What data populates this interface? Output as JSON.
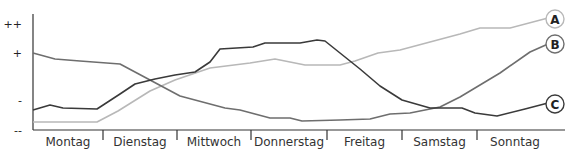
{
  "chart_data": {
    "type": "line",
    "title": "",
    "xlabel": "",
    "ylabel": "",
    "categories": [
      "Montag",
      "Dienstag",
      "Mittwoch",
      "Donnerstag",
      "Freitag",
      "Samstag",
      "Sonntag"
    ],
    "y_ticks": [
      "++",
      "+",
      "-",
      "--"
    ],
    "grid": false,
    "legend_position": "inline-right",
    "series": [
      {
        "name": "A",
        "color": "#b8b8b8",
        "points": [
          [
            33,
            122
          ],
          [
            97,
            122
          ],
          [
            118,
            111
          ],
          [
            150,
            91
          ],
          [
            175,
            80
          ],
          [
            210,
            68
          ],
          [
            250,
            63
          ],
          [
            275,
            59
          ],
          [
            305,
            65
          ],
          [
            340,
            65
          ],
          [
            355,
            61
          ],
          [
            378,
            53
          ],
          [
            400,
            50
          ],
          [
            430,
            42
          ],
          [
            460,
            34
          ],
          [
            480,
            28
          ],
          [
            510,
            28
          ],
          [
            548,
            18
          ]
        ]
      },
      {
        "name": "B",
        "color": "#6e6e6e",
        "points": [
          [
            33,
            53
          ],
          [
            55,
            59
          ],
          [
            80,
            61
          ],
          [
            120,
            64
          ],
          [
            150,
            80
          ],
          [
            180,
            96
          ],
          [
            225,
            108
          ],
          [
            240,
            110
          ],
          [
            270,
            118
          ],
          [
            290,
            118
          ],
          [
            302,
            121
          ],
          [
            340,
            120
          ],
          [
            370,
            119
          ],
          [
            390,
            114
          ],
          [
            410,
            113
          ],
          [
            440,
            107
          ],
          [
            460,
            97
          ],
          [
            500,
            73
          ],
          [
            530,
            52
          ],
          [
            548,
            44
          ]
        ]
      },
      {
        "name": "C",
        "color": "#3a3a3a",
        "points": [
          [
            33,
            110
          ],
          [
            50,
            105
          ],
          [
            63,
            108
          ],
          [
            97,
            109
          ],
          [
            120,
            94
          ],
          [
            135,
            84
          ],
          [
            155,
            79
          ],
          [
            175,
            75
          ],
          [
            195,
            72
          ],
          [
            210,
            62
          ],
          [
            220,
            49
          ],
          [
            253,
            47
          ],
          [
            265,
            43
          ],
          [
            300,
            43
          ],
          [
            317,
            40
          ],
          [
            325,
            41
          ],
          [
            360,
            69
          ],
          [
            380,
            86
          ],
          [
            402,
            100
          ],
          [
            430,
            108
          ],
          [
            462,
            108
          ],
          [
            475,
            113
          ],
          [
            497,
            116
          ],
          [
            525,
            109
          ],
          [
            548,
            103
          ]
        ]
      }
    ],
    "labels": [
      {
        "id": "A",
        "x": 555,
        "y": 19
      },
      {
        "id": "B",
        "x": 555,
        "y": 44
      },
      {
        "id": "C",
        "x": 555,
        "y": 104
      }
    ]
  }
}
